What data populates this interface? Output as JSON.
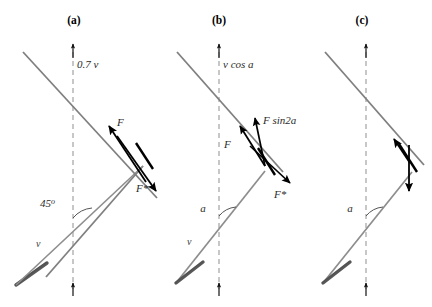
{
  "figure": {
    "width": 432,
    "height": 307,
    "background": "#ffffff",
    "ray_color": "#808080",
    "axis_color": "#9a9a9a",
    "vector_color": "#000000",
    "label_color": "#2b2b2b"
  },
  "panels": [
    {
      "id": "a",
      "label": "(a)",
      "axis_label": "0.7 v",
      "angle_label": "45",
      "angle_degree_mark": "o",
      "incoming_label": "v",
      "vectors": [
        {
          "name": "F",
          "label": "F"
        },
        {
          "name": "F-star",
          "label": "F*"
        }
      ]
    },
    {
      "id": "b",
      "label": "(b)",
      "axis_label": "v cos a",
      "angle_label": "a",
      "incoming_label": "v",
      "vectors": [
        {
          "name": "F",
          "label": "F"
        },
        {
          "name": "F-sin2a",
          "label": "F sin2a"
        },
        {
          "name": "F-star",
          "label": "F*"
        }
      ]
    },
    {
      "id": "c",
      "label": "(c)",
      "axis_label": "",
      "angle_label": "a",
      "incoming_label": "",
      "vectors": [
        {
          "name": "up-left-vector",
          "label": ""
        },
        {
          "name": "down-vector",
          "label": ""
        }
      ]
    }
  ]
}
